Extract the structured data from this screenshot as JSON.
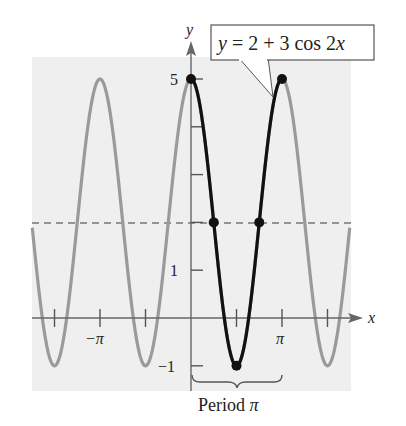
{
  "chart_data": {
    "type": "line",
    "title": "",
    "equation_label": "y = 2 + 3 cos 2x",
    "xlabel": "x",
    "ylabel": "y",
    "x_ticks": [
      {
        "value": -4.712,
        "label": ""
      },
      {
        "value": -3.1416,
        "label": "−π"
      },
      {
        "value": -1.5708,
        "label": ""
      },
      {
        "value": 1.5708,
        "label": ""
      },
      {
        "value": 3.1416,
        "label": "π"
      },
      {
        "value": 4.712,
        "label": ""
      }
    ],
    "y_ticks": [
      {
        "value": -1,
        "label": "−1"
      },
      {
        "value": 1,
        "label": "1"
      },
      {
        "value": 2,
        "label": ""
      },
      {
        "value": 3,
        "label": ""
      },
      {
        "value": 4,
        "label": ""
      },
      {
        "value": 5,
        "label": "5"
      }
    ],
    "xlim": [
      -5.55,
      5.45
    ],
    "ylim": [
      -1.5,
      5.5
    ],
    "grid": false,
    "series": [
      {
        "name": "y = 2 + 3 cos 2x (full)",
        "color": "#999999",
        "function": "2 + 3*cos(2x)",
        "x_range": [
          -5.4,
          5.4
        ]
      },
      {
        "name": "one period [0, π]",
        "color": "#111111",
        "function": "2 + 3*cos(2x)",
        "x_range": [
          0,
          3.1416
        ]
      }
    ],
    "midline": {
      "y": 2,
      "style": "dashed",
      "color": "#777777"
    },
    "key_points": [
      {
        "x": 0,
        "y": 5
      },
      {
        "x": 0.7854,
        "y": 2
      },
      {
        "x": 1.5708,
        "y": -1
      },
      {
        "x": 2.3562,
        "y": 2
      },
      {
        "x": 3.1416,
        "y": 5
      }
    ],
    "annotation": "Period π"
  },
  "labels": {
    "y_axis": "y",
    "x_axis": "x",
    "equation": "y = 2 + 3 cos 2x",
    "eq_y": "y",
    "eq_rest1": " = 2 + 3 cos 2",
    "eq_x": "x",
    "y5": "5",
    "y1": "1",
    "yneg1": "−1",
    "xnegpi": "−π",
    "xpi": "π",
    "period_word": "Period ",
    "period_pi": "π"
  },
  "colors": {
    "panel": "#efefef",
    "gray_curve": "#9a9a9a",
    "black_curve": "#111111",
    "axis": "#666666"
  }
}
